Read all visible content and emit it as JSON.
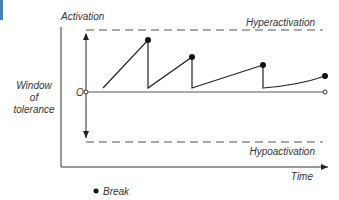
{
  "diagram": {
    "y_axis_label": "Activation",
    "x_axis_label": "Time",
    "upper_threshold_label": "Hyperactivation",
    "lower_threshold_label": "Hypoactivation",
    "window_label_line1": "Window",
    "window_label_line2": "of",
    "window_label_line3": "tolerance",
    "origin_label": "O",
    "legend": {
      "marker": "filled-circle",
      "label": "Break"
    },
    "colors": {
      "line": "#222222",
      "text": "#333333",
      "dashed": "#555555",
      "edge_accent": "#4a7fb5"
    },
    "series": {
      "name": "Activation over time",
      "segments": [
        {
          "rise_from": [
            103,
            88
          ],
          "peak": [
            148,
            40
          ]
        },
        {
          "rise_from": [
            148,
            88
          ],
          "peak": [
            192,
            57
          ]
        },
        {
          "rise_from": [
            192,
            88
          ],
          "peak": [
            263,
            65
          ]
        },
        {
          "rise_from": [
            263,
            88
          ],
          "peak": [
            325,
            76
          ]
        }
      ]
    }
  }
}
